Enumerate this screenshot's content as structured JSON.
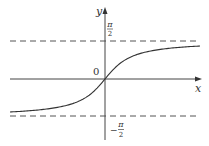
{
  "chart_data": {
    "type": "line",
    "title": "",
    "function": "y = arctan(x)",
    "xlabel": "x",
    "ylabel": "y",
    "origin_label": "0",
    "asymptotes": [
      {
        "y": 1.5708,
        "label_num": "π",
        "label_den": "2",
        "label_sign": "",
        "style": "dashed"
      },
      {
        "y": -1.5708,
        "label_num": "π",
        "label_den": "2",
        "label_sign": "−",
        "style": "dashed"
      }
    ],
    "xlim": [
      -4.75,
      4.75
    ],
    "ylim": [
      -2.8,
      2.9
    ],
    "grid": false,
    "x": [
      -4.75,
      -4,
      -3,
      -2,
      -1.5,
      -1,
      -0.5,
      0,
      0.5,
      1,
      1.5,
      2,
      3,
      4,
      4.75
    ],
    "values": [
      -1.3633,
      -1.3258,
      -1.249,
      -1.1071,
      -0.9828,
      -0.7854,
      -0.4636,
      0,
      0.4636,
      0.7854,
      0.9828,
      1.1071,
      1.249,
      1.3258,
      1.3633
    ],
    "colors": {
      "axis": "#444444",
      "curve": "#333333",
      "asymptote": "#555555"
    }
  }
}
